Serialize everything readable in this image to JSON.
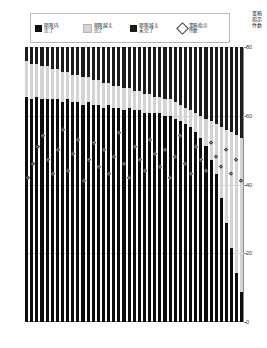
{
  "legend": {
    "items": [
      {
        "name": "ontime-done",
        "label": "期限内\n完了",
        "marker": "square",
        "color": "#0d0d0d"
      },
      {
        "name": "late-done",
        "label": "期限越え\n完了",
        "marker": "square",
        "color": "#d4d4d4"
      },
      {
        "name": "late-open",
        "label": "期限越え\n未完了",
        "marker": "square",
        "color": "#1c1c1c"
      },
      {
        "name": "instruction-count",
        "label": "業務指示\n件数",
        "marker": "diamond",
        "color": "#ffffff"
      }
    ]
  },
  "axis_right_title": "業務\n指示\n件数",
  "chart_data": {
    "type": "bar",
    "title": "",
    "xlabel": "",
    "ylabel": "",
    "y2label": "業務指示件数",
    "stacked": "100%",
    "grid": true,
    "legend_position": "top",
    "ylim": [
      0,
      100
    ],
    "y2lim": [
      0,
      80
    ],
    "y2ticks": [
      0,
      20,
      40,
      60,
      80
    ],
    "y2ticklabels": [
      "0",
      "20",
      "40",
      "60",
      "80"
    ],
    "categories": [
      "1",
      "2",
      "3",
      "4",
      "5",
      "6",
      "7",
      "8",
      "9",
      "10",
      "11",
      "12",
      "13",
      "14",
      "15",
      "16",
      "17",
      "18",
      "19",
      "20",
      "21",
      "22",
      "23",
      "24",
      "25",
      "26",
      "27",
      "28",
      "29",
      "30",
      "31",
      "32",
      "33",
      "34",
      "35",
      "36",
      "37",
      "38",
      "39",
      "40",
      "41",
      "42",
      "43"
    ],
    "series": [
      {
        "name": "期限越え未完了",
        "color": "#1c1c1c",
        "values": [
          5,
          6,
          6,
          7,
          7,
          8,
          8,
          9,
          9,
          10,
          10,
          11,
          11,
          12,
          12,
          13,
          13,
          14,
          14,
          15,
          15,
          16,
          16,
          17,
          17,
          18,
          18,
          19,
          19,
          20,
          21,
          22,
          23,
          24,
          25,
          26,
          27,
          28,
          29,
          30,
          31,
          32,
          33
        ]
      },
      {
        "name": "期限越え完了",
        "color": "#d4d4d4",
        "values": [
          13,
          13,
          12,
          12,
          12,
          11,
          11,
          11,
          10,
          10,
          10,
          10,
          9,
          9,
          9,
          9,
          8,
          8,
          8,
          8,
          7,
          7,
          7,
          7,
          7,
          6,
          6,
          6,
          6,
          6,
          6,
          6,
          6,
          7,
          8,
          10,
          14,
          18,
          26,
          34,
          42,
          50,
          56
        ]
      },
      {
        "name": "期限内完了",
        "color": "#0d0d0d",
        "values": [
          82,
          81,
          82,
          81,
          81,
          81,
          81,
          80,
          81,
          80,
          80,
          79,
          80,
          79,
          79,
          78,
          79,
          78,
          78,
          77,
          78,
          77,
          77,
          76,
          76,
          76,
          76,
          75,
          75,
          74,
          73,
          72,
          71,
          69,
          67,
          64,
          59,
          54,
          45,
          36,
          27,
          18,
          11
        ]
      }
    ],
    "overlay_series": {
      "name": "業務指示件数",
      "type": "scatter",
      "marker": "diamond",
      "axis": "y2",
      "values": [
        42,
        46,
        51,
        54,
        47,
        43,
        50,
        56,
        44,
        49,
        53,
        41,
        47,
        52,
        45,
        50,
        43,
        48,
        55,
        46,
        42,
        51,
        47,
        44,
        53,
        49,
        45,
        50,
        42,
        48,
        54,
        46,
        43,
        51,
        47,
        44,
        52,
        48,
        45,
        50,
        43,
        47,
        41
      ]
    }
  },
  "xticklabels": [
    "",
    "",
    "",
    "",
    "",
    "",
    "",
    "",
    "",
    "",
    "",
    "",
    "",
    "",
    "",
    "",
    "",
    "",
    "",
    "",
    "",
    "",
    "",
    "",
    "",
    "",
    "",
    "",
    "",
    "",
    "",
    "",
    "",
    "",
    "",
    "",
    "",
    "",
    "",
    "",
    "",
    "",
    ""
  ]
}
